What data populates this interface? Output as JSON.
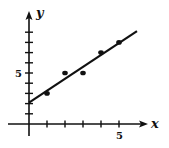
{
  "chart_data": {
    "type": "scatter",
    "title": "",
    "xlabel": "x",
    "ylabel": "y",
    "xlim": [
      0,
      6.5
    ],
    "ylim": [
      0,
      9.5
    ],
    "x_ticks": [
      1,
      2,
      3,
      4,
      5
    ],
    "y_ticks": [
      1,
      2,
      3,
      4,
      5,
      6,
      7,
      8,
      9
    ],
    "x_tick_labels": [
      {
        "value": 5,
        "label": "5"
      }
    ],
    "y_tick_labels": [
      {
        "value": 5,
        "label": "5"
      }
    ],
    "grid": false,
    "legend": null,
    "series": [
      {
        "name": "data points",
        "type": "scatter",
        "x": [
          1,
          2,
          3,
          4,
          5
        ],
        "y": [
          3,
          5,
          5,
          7,
          8
        ]
      },
      {
        "name": "line of best fit",
        "type": "line",
        "x": [
          0,
          6
        ],
        "y": [
          2.1,
          9.1
        ]
      }
    ]
  },
  "labels": {
    "x_axis": "x",
    "y_axis": "y",
    "x_five": "5",
    "y_five": "5"
  }
}
